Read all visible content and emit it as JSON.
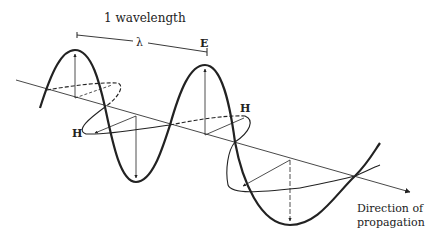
{
  "diagram": {
    "wavelength_label": "1 wavelength",
    "lambda_symbol": "λ",
    "e_field_label": "E",
    "h_field_label_left": "H",
    "h_field_label_right": "H",
    "direction_label_line1": "Direction of",
    "direction_label_line2": "propagation",
    "colors": {
      "ink": "#222222",
      "background": "#ffffff"
    }
  }
}
